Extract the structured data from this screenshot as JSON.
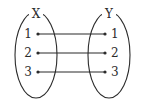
{
  "diagram": {
    "background_color": "#ffffff",
    "ink_color": "#2b2b2b",
    "domain_set": {
      "label": "X",
      "label_x": 36,
      "label_y": 17,
      "ellipse": {
        "cx": 36,
        "cy": 55,
        "rx": 21,
        "ry": 43
      },
      "elements": [
        {
          "label": "1",
          "dot_x": 38,
          "dot_y": 34,
          "text_x": 32,
          "text_y": 34
        },
        {
          "label": "2",
          "dot_x": 38,
          "dot_y": 53,
          "text_x": 32,
          "text_y": 53
        },
        {
          "label": "3",
          "dot_x": 38,
          "dot_y": 72,
          "text_x": 32,
          "text_y": 72
        }
      ]
    },
    "codomain_set": {
      "label": "Y",
      "label_x": 109,
      "label_y": 17,
      "ellipse": {
        "cx": 109,
        "cy": 55,
        "rx": 21,
        "ry": 43
      },
      "elements": [
        {
          "label": "1",
          "dot_x": 105,
          "dot_y": 34,
          "text_x": 111,
          "text_y": 34
        },
        {
          "label": "2",
          "dot_x": 105,
          "dot_y": 53,
          "text_x": 111,
          "text_y": 53
        },
        {
          "label": "3",
          "dot_x": 105,
          "dot_y": 72,
          "text_x": 111,
          "text_y": 72
        }
      ]
    },
    "edges": [
      {
        "from": "1",
        "to": "1",
        "x1": 38,
        "y1": 34,
        "x2": 105,
        "y2": 34
      },
      {
        "from": "2",
        "to": "2",
        "x1": 38,
        "y1": 53,
        "x2": 105,
        "y2": 53
      },
      {
        "from": "3",
        "to": "3",
        "x1": 38,
        "y1": 72,
        "x2": 105,
        "y2": 72
      }
    ],
    "dot_radius": 1.6
  }
}
